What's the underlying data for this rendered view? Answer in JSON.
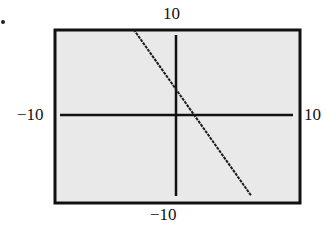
{
  "marker": ".",
  "window": {
    "xmin_label": "−10",
    "xmax_label": "10",
    "ymin_label": "−10",
    "ymax_label": "10"
  },
  "colors": {
    "background": "#e9e9e9",
    "frame": "#111111",
    "axes": "#111111",
    "line": "#1a1a1a"
  },
  "chart_data": {
    "type": "line",
    "title": "",
    "xlabel": "",
    "ylabel": "",
    "xlim": [
      -10,
      10
    ],
    "ylim": [
      -10,
      10
    ],
    "grid": false,
    "legend": null,
    "tick_labels": {
      "x": [
        "-10",
        "10"
      ],
      "y": [
        "-10",
        "10"
      ]
    },
    "series": [
      {
        "name": "line",
        "equation_estimate": "y = -2x + 3",
        "x": [
          -3.5,
          0,
          1.5,
          6.2
        ],
        "y": [
          10,
          3,
          0,
          -9.4
        ]
      }
    ]
  }
}
